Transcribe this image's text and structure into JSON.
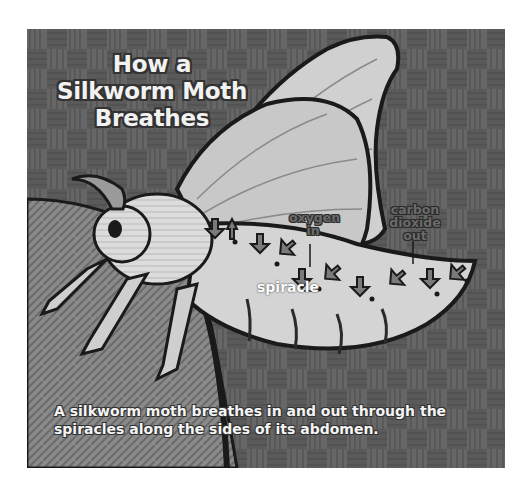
{
  "figure": {
    "title_lines": [
      "How a",
      "Silkworm Moth",
      "Breathes"
    ],
    "labels": {
      "oxygen": [
        "oxygen",
        "in"
      ],
      "carbon_dioxide": [
        "carbon",
        "dioxide",
        "out"
      ],
      "spiracle": "spiracle"
    },
    "caption_lines": [
      "A silkworm moth breathes in and out through the",
      "spiracles along the sides of its abdomen."
    ],
    "colors": {
      "background_weave": "#5e5e5e",
      "wing": "#cfcfcf",
      "body": "#d8d8d8",
      "outline": "#1a1a1a",
      "arrow_fill": "#7a7a7a"
    }
  }
}
